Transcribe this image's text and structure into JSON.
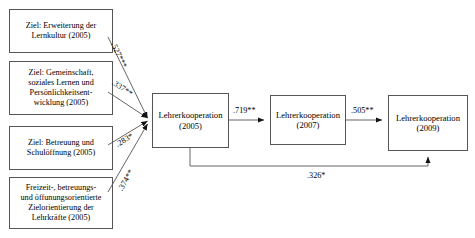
{
  "diagram": {
    "type": "path-model",
    "title": "",
    "nodes": [
      {
        "id": "ziel-lernkultur",
        "label": "Ziel: Erweiterung der\nLernkultur (2005)",
        "role": "exogenous",
        "year": "2005"
      },
      {
        "id": "ziel-gemeinschaft",
        "label": "Ziel: Gemeinschaft,\nsoziales Lernen und\nPersönlichkeitsent-\nwicklung (2005)",
        "role": "exogenous",
        "year": "2005"
      },
      {
        "id": "ziel-betreuung",
        "label": "Ziel: Betreuung und\nSchulöffnung (2005)",
        "role": "exogenous",
        "year": "2005"
      },
      {
        "id": "freizeit-zielorientierung",
        "label": "Freizeit-, betreuungs-\nund öffunungsorientierte\nZielorientierung der\nLehrkräfte (2005)",
        "role": "exogenous",
        "year": "2005"
      },
      {
        "id": "lehrerkooperation-2005",
        "label": "Lehrerkooperation\n(2005)",
        "role": "endogenous",
        "year": "2005"
      },
      {
        "id": "lehrerkooperation-2007",
        "label": "Lehrerkooperation\n(2007)",
        "role": "endogenous",
        "year": "2007"
      },
      {
        "id": "lehrerkooperation-2009",
        "label": "Lehrerkooperation\n(2009)",
        "role": "endogenous",
        "year": "2009"
      }
    ],
    "edges": [
      {
        "id": "e1",
        "from": "ziel-lernkultur",
        "to": "lehrerkooperation-2005",
        "coefficient": ".527***",
        "significance": "***"
      },
      {
        "id": "e2",
        "from": "ziel-gemeinschaft",
        "to": "lehrerkooperation-2005",
        "coefficient": ".337**",
        "significance": "**"
      },
      {
        "id": "e3",
        "from": "ziel-betreuung",
        "to": "lehrerkooperation-2005",
        "coefficient": ".283*",
        "significance": "*"
      },
      {
        "id": "e4",
        "from": "freizeit-zielorientierung",
        "to": "lehrerkooperation-2005",
        "coefficient": ".374**",
        "significance": "**"
      },
      {
        "id": "e5",
        "from": "lehrerkooperation-2005",
        "to": "lehrerkooperation-2007",
        "coefficient": ".719**",
        "significance": "**"
      },
      {
        "id": "e6",
        "from": "lehrerkooperation-2007",
        "to": "lehrerkooperation-2009",
        "coefficient": ".505**",
        "significance": "**"
      },
      {
        "id": "e7",
        "from": "lehrerkooperation-2005",
        "to": "lehrerkooperation-2009",
        "coefficient": ".326*",
        "significance": "*"
      }
    ],
    "colors": {
      "stroke": "#555555",
      "text": "#000000",
      "background": "#ffffff"
    }
  }
}
